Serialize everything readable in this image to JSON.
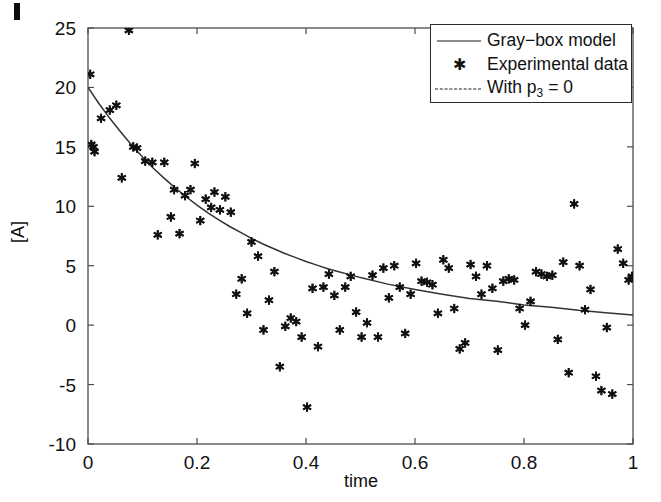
{
  "figure": {
    "name": "gray-box-model-fit-plot",
    "background_color": "#ffffff",
    "axis_color": "#4d4d4d",
    "marker_color": "#111111",
    "curve_color": "#333333"
  },
  "axes": {
    "xlabel": "time",
    "ylabel": "[A]",
    "xlim": [
      0,
      1
    ],
    "ylim": [
      -10,
      25
    ],
    "xticks": [
      "0",
      "0.2",
      "0.4",
      "0.6",
      "0.8",
      "1"
    ],
    "xtick_values": [
      0,
      0.2,
      0.4,
      0.6,
      0.8,
      1
    ],
    "yticks": [
      "25",
      "20",
      "15",
      "10",
      "5",
      "0",
      "-5",
      "-10"
    ],
    "ytick_values": [
      25,
      20,
      15,
      10,
      5,
      0,
      -5,
      -10
    ],
    "grid": false,
    "box": true,
    "tick_direction": "in"
  },
  "legend": {
    "position": "top-right",
    "entries": [
      {
        "label": "Gray−box model",
        "key": "solid-line",
        "name": "legend-gray-box-model"
      },
      {
        "label": "Experimental data",
        "key": "star-marker",
        "name": "legend-experimental-data"
      },
      {
        "label": "With p",
        "label_sub": "3",
        "label_tail": " = 0",
        "key": "dashed-line",
        "name": "legend-with-p3-zero"
      }
    ]
  },
  "chart_data": {
    "type": "scatter",
    "title": "",
    "xlabel": "time",
    "ylabel": "[A]",
    "xlim": [
      0,
      1
    ],
    "ylim": [
      -10,
      25
    ],
    "grid": false,
    "legend_position": "upper right",
    "series": [
      {
        "name": "Gray−box model",
        "type": "line",
        "style": "solid",
        "color": "#333333",
        "x": [
          0.0,
          0.02,
          0.04,
          0.06,
          0.08,
          0.1,
          0.12,
          0.14,
          0.16,
          0.18,
          0.2,
          0.22,
          0.24,
          0.26,
          0.28,
          0.3,
          0.32,
          0.34,
          0.36,
          0.38,
          0.4,
          0.42,
          0.44,
          0.46,
          0.48,
          0.5,
          0.55,
          0.6,
          0.65,
          0.7,
          0.75,
          0.8,
          0.85,
          0.9,
          0.95,
          1.0
        ],
        "y": [
          20.0,
          18.65,
          17.4,
          16.25,
          15.15,
          14.15,
          13.2,
          12.35,
          11.55,
          10.8,
          10.1,
          9.45,
          8.85,
          8.3,
          7.8,
          7.3,
          6.85,
          6.45,
          6.05,
          5.7,
          5.35,
          5.05,
          4.75,
          4.5,
          4.25,
          4.0,
          3.45,
          3.0,
          2.6,
          2.25,
          2.0,
          1.7,
          1.5,
          1.25,
          1.05,
          0.85
        ]
      },
      {
        "name": "With p₃ = 0",
        "type": "line",
        "style": "dashed",
        "color": "#333333",
        "note": "legend entry only; curve overlaps the gray-box model within the axes",
        "x": [],
        "y": []
      },
      {
        "name": "Experimental data",
        "type": "scatter",
        "marker": "*",
        "color": "#111111",
        "x": [
          0.004,
          0.006,
          0.01,
          0.012,
          0.024,
          0.04,
          0.052,
          0.062,
          0.075,
          0.083,
          0.09,
          0.105,
          0.118,
          0.128,
          0.14,
          0.152,
          0.158,
          0.168,
          0.178,
          0.188,
          0.196,
          0.206,
          0.216,
          0.226,
          0.232,
          0.242,
          0.252,
          0.262,
          0.272,
          0.282,
          0.292,
          0.3,
          0.312,
          0.322,
          0.332,
          0.342,
          0.352,
          0.362,
          0.372,
          0.382,
          0.392,
          0.402,
          0.412,
          0.422,
          0.432,
          0.442,
          0.452,
          0.462,
          0.472,
          0.482,
          0.492,
          0.502,
          0.512,
          0.522,
          0.532,
          0.542,
          0.552,
          0.562,
          0.572,
          0.582,
          0.592,
          0.602,
          0.612,
          0.622,
          0.632,
          0.642,
          0.652,
          0.662,
          0.672,
          0.682,
          0.692,
          0.702,
          0.712,
          0.722,
          0.732,
          0.742,
          0.752,
          0.762,
          0.772,
          0.782,
          0.792,
          0.802,
          0.812,
          0.822,
          0.832,
          0.842,
          0.852,
          0.862,
          0.872,
          0.882,
          0.892,
          0.902,
          0.912,
          0.922,
          0.932,
          0.942,
          0.952,
          0.962,
          0.972,
          0.982,
          0.992,
          0.998
        ],
        "y": [
          21.1,
          15.2,
          15.0,
          14.6,
          17.4,
          18.1,
          18.5,
          12.4,
          24.8,
          15.0,
          14.9,
          13.8,
          13.7,
          7.6,
          13.7,
          9.1,
          11.4,
          7.7,
          10.9,
          11.4,
          13.6,
          8.8,
          10.6,
          9.9,
          11.2,
          9.7,
          10.8,
          9.5,
          2.6,
          3.9,
          1.0,
          7.0,
          5.8,
          -0.4,
          2.1,
          4.5,
          -3.5,
          -0.1,
          0.6,
          0.3,
          -1.0,
          -6.9,
          3.1,
          -1.8,
          3.2,
          4.3,
          2.5,
          -0.4,
          3.2,
          4.1,
          1.1,
          -1.0,
          0.2,
          4.2,
          -1.0,
          4.8,
          2.3,
          5.0,
          3.2,
          -0.7,
          2.6,
          5.2,
          3.7,
          3.6,
          3.4,
          1.0,
          5.5,
          4.8,
          1.4,
          -2.0,
          -1.5,
          5.1,
          4.1,
          2.6,
          5.0,
          3.1,
          -2.1,
          3.7,
          3.9,
          3.8,
          1.4,
          0.0,
          2.0,
          4.5,
          4.3,
          4.1,
          4.2,
          -1.2,
          5.3,
          -4.0,
          10.2,
          5.0,
          1.3,
          3.0,
          -4.3,
          -5.5,
          -0.2,
          -5.8,
          6.4,
          5.2,
          3.8,
          4.1
        ]
      }
    ]
  }
}
